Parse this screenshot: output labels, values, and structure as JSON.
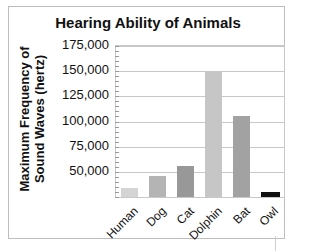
{
  "chart_data": {
    "type": "bar",
    "title": "Hearing Ability of Animals",
    "xlabel": "",
    "ylabel": "Maximum Frequency of Sound Waves (hertz)",
    "ylabel_lines": [
      "Maximum Frequency of",
      "Sound Waves (hertz)"
    ],
    "categories": [
      "Human",
      "Dog",
      "Cat",
      "Dolphin",
      "Bat",
      "Owl"
    ],
    "values": [
      34000,
      46000,
      56000,
      150000,
      105000,
      30000
    ],
    "bar_colors": [
      "#d4d4d4",
      "#b4b4b4",
      "#989898",
      "#c6c6c6",
      "#a2a2a2",
      "#111111"
    ],
    "ylim": [
      25000,
      175000
    ],
    "yticks": [
      50000,
      75000,
      100000,
      125000,
      150000,
      175000
    ],
    "ytick_labels": [
      "50,000",
      "75,000",
      "100,000",
      "125,000",
      "150,000",
      "175,000"
    ],
    "grid": true,
    "legend": null
  }
}
